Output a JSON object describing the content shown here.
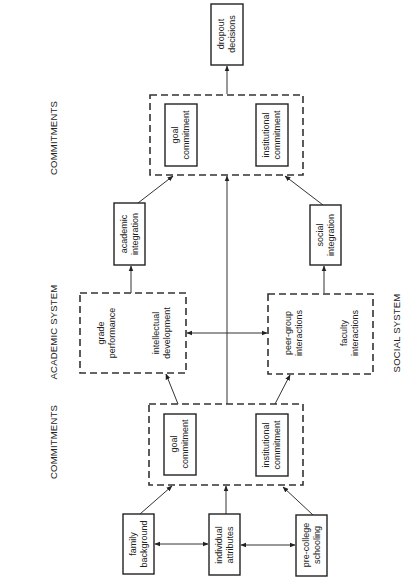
{
  "labels": {
    "commitments_top": "COMMITMENTS",
    "academic_system": "ACADEMIC SYSTEM",
    "commitments_bottom": "COMMITMENTS",
    "social_system": "SOCIAL SYSTEM"
  },
  "nodes": {
    "dropout": [
      "dropout",
      "decisions"
    ],
    "goal_top": [
      "goal",
      "commitment"
    ],
    "inst_top": [
      "institutional",
      "commitment"
    ],
    "academic_integration": [
      "academic",
      "integration"
    ],
    "social_integration": [
      "social",
      "integration"
    ],
    "grade": [
      "grade",
      "performance"
    ],
    "intellectual": [
      "intellectual",
      "development"
    ],
    "peer": [
      "peer-group",
      "interactions"
    ],
    "faculty": [
      "faculty",
      "interactions"
    ],
    "goal_bottom": [
      "goal",
      "commitment"
    ],
    "inst_bottom": [
      "institutional",
      "commitment"
    ],
    "family": [
      "family",
      "background"
    ],
    "individual": [
      "individual",
      "attributes"
    ],
    "precollege": [
      "pre-college",
      "schooling"
    ]
  }
}
